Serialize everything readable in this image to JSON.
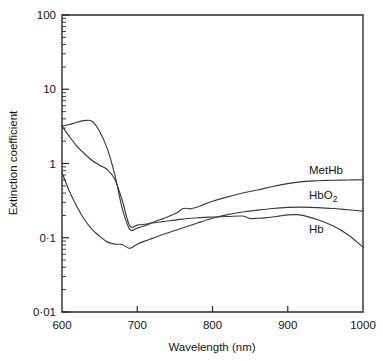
{
  "chart_data": {
    "type": "line",
    "title": "",
    "xlabel": "Wavelength (nm)",
    "ylabel": "Extinction coefficient",
    "xlim": [
      600,
      1000
    ],
    "ylim": [
      0.01,
      100
    ],
    "yscale": "log",
    "xscale": "linear",
    "grid": false,
    "legend_position": "inline-right-of-curve",
    "x_ticks": [
      "600",
      "700",
      "800",
      "900",
      "1000"
    ],
    "x_tick_values": [
      600,
      700,
      800,
      900,
      1000
    ],
    "y_ticks": [
      "0·01",
      "0·1",
      "1",
      "10",
      "100"
    ],
    "y_tick_values": [
      0.01,
      0.1,
      1,
      10,
      100
    ],
    "series": [
      {
        "name": "MetHb",
        "label": "MetHb",
        "label_sub": "",
        "x": [
          600,
          610,
          620,
          630,
          640,
          650,
          660,
          670,
          680,
          690,
          700,
          710,
          720,
          730,
          740,
          750,
          755,
          760,
          765,
          770,
          780,
          790,
          800,
          820,
          840,
          860,
          880,
          900,
          920,
          940,
          960,
          980,
          1000
        ],
        "y": [
          3.2,
          3.35,
          3.6,
          3.78,
          3.7,
          2.7,
          1.6,
          0.72,
          0.25,
          0.13,
          0.135,
          0.145,
          0.16,
          0.175,
          0.19,
          0.21,
          0.225,
          0.245,
          0.25,
          0.245,
          0.26,
          0.285,
          0.31,
          0.355,
          0.4,
          0.44,
          0.49,
          0.535,
          0.57,
          0.585,
          0.595,
          0.6,
          0.605
        ]
      },
      {
        "name": "HbO2",
        "label": "HbO",
        "label_sub": "2",
        "x": [
          600,
          610,
          620,
          630,
          640,
          650,
          660,
          670,
          680,
          690,
          700,
          710,
          720,
          730,
          740,
          760,
          780,
          800,
          820,
          840,
          860,
          880,
          900,
          920,
          940,
          960,
          980,
          1000
        ],
        "y": [
          0.75,
          0.42,
          0.26,
          0.175,
          0.13,
          0.105,
          0.088,
          0.082,
          0.081,
          0.072,
          0.082,
          0.09,
          0.098,
          0.107,
          0.116,
          0.135,
          0.158,
          0.183,
          0.205,
          0.222,
          0.236,
          0.248,
          0.256,
          0.258,
          0.255,
          0.248,
          0.238,
          0.228
        ]
      },
      {
        "name": "Hb",
        "label": "Hb",
        "label_sub": "",
        "x": [
          600,
          610,
          620,
          630,
          640,
          650,
          660,
          670,
          680,
          690,
          700,
          710,
          720,
          730,
          740,
          750,
          760,
          780,
          800,
          820,
          840,
          850,
          860,
          870,
          880,
          890,
          900,
          910,
          920,
          940,
          960,
          980,
          1000
        ],
        "y": [
          3.2,
          2.3,
          1.7,
          1.35,
          1.1,
          0.95,
          0.83,
          0.62,
          0.32,
          0.145,
          0.148,
          0.152,
          0.158,
          0.163,
          0.168,
          0.173,
          0.178,
          0.186,
          0.19,
          0.193,
          0.196,
          0.182,
          0.183,
          0.185,
          0.19,
          0.197,
          0.203,
          0.205,
          0.2,
          0.175,
          0.145,
          0.11,
          0.075
        ]
      }
    ]
  },
  "axes": {
    "x_axis_title": "Wavelength (nm)",
    "y_axis_title": "Extinction coefficient"
  },
  "labels": {
    "methb": "MetHb",
    "hbo2_main": "HbO",
    "hbo2_sub": "2",
    "hb": "Hb"
  },
  "colors": {
    "curve": "#3a3a3a",
    "axis": "#2b2b2b",
    "text": "#141414",
    "background": "#ffffff"
  }
}
